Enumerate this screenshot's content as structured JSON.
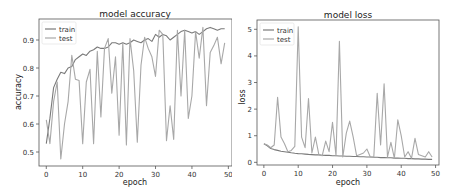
{
  "figure": {
    "background": "#ffffff"
  },
  "chart_data": [
    {
      "type": "line",
      "title": "model accuracy",
      "xlabel": "epoch",
      "ylabel": "accuracy",
      "xlim": [
        -2,
        51
      ],
      "ylim": [
        0.45,
        0.975
      ],
      "xticks": [
        0,
        10,
        20,
        30,
        40,
        50
      ],
      "yticks": [
        0.5,
        0.6,
        0.7,
        0.8,
        0.9
      ],
      "ytick_labels": [
        "0.5",
        "0.6",
        "0.7",
        "0.8",
        "0.9"
      ],
      "xtick_labels": [
        "0",
        "10",
        "20",
        "30",
        "40",
        "50"
      ],
      "grid": false,
      "legend": {
        "position": "upper left",
        "entries": [
          "train",
          "test"
        ]
      },
      "x": [
        0,
        1,
        2,
        3,
        4,
        5,
        6,
        7,
        8,
        9,
        10,
        11,
        12,
        13,
        14,
        15,
        16,
        17,
        18,
        19,
        20,
        21,
        22,
        23,
        24,
        25,
        26,
        27,
        28,
        29,
        30,
        31,
        32,
        33,
        34,
        35,
        36,
        37,
        38,
        39,
        40,
        41,
        42,
        43,
        44,
        45,
        46,
        47,
        48,
        49
      ],
      "series": [
        {
          "name": "train",
          "color": "#7a7a7a",
          "values": [
            0.53,
            0.62,
            0.73,
            0.76,
            0.785,
            0.78,
            0.8,
            0.805,
            0.83,
            0.84,
            0.85,
            0.845,
            0.86,
            0.865,
            0.875,
            0.87,
            0.87,
            0.875,
            0.89,
            0.89,
            0.885,
            0.89,
            0.885,
            0.89,
            0.9,
            0.895,
            0.89,
            0.9,
            0.905,
            0.895,
            0.92,
            0.91,
            0.92,
            0.915,
            0.9,
            0.91,
            0.92,
            0.93,
            0.935,
            0.93,
            0.925,
            0.93,
            0.92,
            0.93,
            0.94,
            0.945,
            0.94,
            0.935,
            0.94,
            0.94
          ]
        },
        {
          "name": "test",
          "color": "#a8a8a8",
          "values": [
            0.615,
            0.53,
            0.68,
            0.75,
            0.475,
            0.6,
            0.68,
            0.845,
            0.76,
            0.755,
            0.53,
            0.75,
            0.795,
            0.53,
            0.86,
            0.625,
            0.87,
            0.905,
            0.71,
            0.84,
            0.56,
            0.89,
            0.525,
            0.905,
            0.79,
            0.535,
            0.81,
            0.91,
            0.87,
            0.84,
            0.77,
            0.935,
            0.92,
            0.54,
            0.665,
            0.545,
            0.935,
            0.7,
            0.935,
            0.62,
            0.7,
            0.93,
            0.835,
            0.945,
            0.665,
            0.855,
            0.88,
            0.91,
            0.815,
            0.89
          ]
        }
      ]
    },
    {
      "type": "line",
      "title": "model loss",
      "xlabel": "epoch",
      "ylabel": "loss",
      "xlim": [
        -2,
        51
      ],
      "ylim": [
        -0.1,
        5.35
      ],
      "xticks": [
        0,
        10,
        20,
        30,
        40,
        50
      ],
      "yticks": [
        0,
        1,
        2,
        3,
        4,
        5
      ],
      "ytick_labels": [
        "0",
        "1",
        "2",
        "3",
        "4",
        "5"
      ],
      "xtick_labels": [
        "0",
        "10",
        "20",
        "30",
        "40",
        "50"
      ],
      "grid": false,
      "legend": {
        "position": "upper left",
        "entries": [
          "train",
          "test"
        ]
      },
      "x": [
        0,
        1,
        2,
        3,
        4,
        5,
        6,
        7,
        8,
        9,
        10,
        11,
        12,
        13,
        14,
        15,
        16,
        17,
        18,
        19,
        20,
        21,
        22,
        23,
        24,
        25,
        26,
        27,
        28,
        29,
        30,
        31,
        32,
        33,
        34,
        35,
        36,
        37,
        38,
        39,
        40,
        41,
        42,
        43,
        44,
        45,
        46,
        47,
        48,
        49
      ],
      "series": [
        {
          "name": "train",
          "color": "#7a7a7a",
          "values": [
            0.7,
            0.62,
            0.52,
            0.48,
            0.45,
            0.42,
            0.4,
            0.38,
            0.36,
            0.34,
            0.33,
            0.32,
            0.31,
            0.3,
            0.29,
            0.28,
            0.28,
            0.27,
            0.26,
            0.26,
            0.25,
            0.25,
            0.24,
            0.24,
            0.23,
            0.23,
            0.22,
            0.22,
            0.21,
            0.21,
            0.2,
            0.2,
            0.19,
            0.19,
            0.18,
            0.18,
            0.17,
            0.17,
            0.16,
            0.16,
            0.15,
            0.15,
            0.14,
            0.14,
            0.13,
            0.13,
            0.12,
            0.12,
            0.11,
            0.11
          ]
        },
        {
          "name": "test",
          "color": "#a8a8a8",
          "values": [
            0.7,
            0.65,
            0.55,
            0.65,
            2.45,
            0.95,
            0.7,
            0.4,
            0.45,
            0.6,
            5.1,
            0.95,
            0.55,
            2.4,
            0.35,
            0.95,
            0.3,
            0.25,
            0.8,
            0.4,
            1.5,
            0.25,
            4.55,
            0.2,
            1.1,
            1.55,
            0.95,
            0.25,
            0.3,
            0.35,
            0.5,
            0.2,
            0.2,
            2.6,
            0.65,
            2.95,
            0.2,
            0.75,
            0.15,
            1.6,
            1.0,
            0.2,
            0.4,
            0.15,
            0.9,
            0.3,
            0.25,
            0.2,
            0.4,
            0.2
          ]
        }
      ]
    }
  ]
}
